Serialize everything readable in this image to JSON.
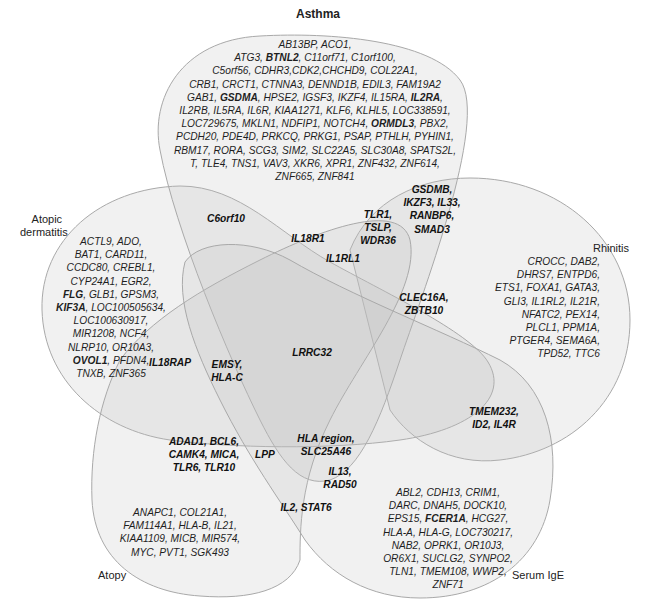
{
  "chart_data": {
    "type": "venn",
    "title": "",
    "sets": [
      "Asthma",
      "Rhinitis",
      "Serum IgE",
      "Atopy",
      "Atopic dermatitis"
    ],
    "note": "Bold gene names are shown in bold in the figure.",
    "regions": [
      {
        "id": "asthma_only",
        "sets": [
          "Asthma"
        ],
        "genes": [
          "AB13BP",
          "ACO1",
          "ATG3",
          "BTNL2",
          "C11orf71",
          "C1orf100",
          "C5orf56",
          "CDHR3",
          "CDK2",
          "CHCHD9",
          "COL22A1",
          "CRB1",
          "CRCT1",
          "CTNNA3",
          "DENND1B",
          "EDIL3",
          "FAM19A2",
          "GAB1",
          "GSDMA",
          "HPSE2",
          "IGSF3",
          "IKZF4",
          "IL15RA",
          "IL2RA",
          "IL2RB",
          "IL5RA",
          "IL6R",
          "KIAA1271",
          "KLF6",
          "KLHL5",
          "LOC338591",
          "LOC729675",
          "MKLN1",
          "NDFIP1",
          "NOTCH4",
          "ORMDL3",
          "PBX2",
          "PCDH20",
          "PDE4D",
          "PRKCQ",
          "PRKG1",
          "PSAP",
          "PTHLH",
          "PYHIN1",
          "RBM17",
          "RORA",
          "SCG3",
          "SIM2",
          "SLC22A5",
          "SLC30A8",
          "SPATS2L",
          "T",
          "TLE4",
          "TNS1",
          "VAV3",
          "XKR6",
          "XPR1",
          "ZNF432",
          "ZNF614",
          "ZNF665",
          "ZNF841"
        ],
        "bold": [
          "BTNL2",
          "GSDMA",
          "IL2RA",
          "ORMDL3"
        ]
      },
      {
        "id": "atopic_dermatitis_only",
        "sets": [
          "Atopic dermatitis"
        ],
        "genes": [
          "ACTL9",
          "ADO",
          "BAT1",
          "CARD11",
          "CCDC80",
          "CREBL1",
          "CYP24A1",
          "EGR2",
          "FLG",
          "GLB1",
          "GPSM3",
          "KIF3A",
          "LOC100505634",
          "LOC100630917",
          "MIR1208",
          "NCF4",
          "NLRP10",
          "OR10A3",
          "OVOL1",
          "PFDN4",
          "TNXB",
          "ZNF365"
        ],
        "bold": [
          "FLG",
          "KIF3A",
          "OVOL1"
        ]
      },
      {
        "id": "rhinitis_only",
        "sets": [
          "Rhinitis"
        ],
        "genes": [
          "CROCC",
          "DAB2",
          "DHRS7",
          "ENTPD6",
          "ETS1",
          "FOXA1",
          "GATA3",
          "GLI3",
          "IL1RL2",
          "IL21R",
          "NFATC2",
          "PEX14",
          "PLCL1",
          "PPM1A",
          "PTGER4",
          "SEMA6A",
          "TPD52",
          "TTC6"
        ],
        "bold": []
      },
      {
        "id": "atopy_only",
        "sets": [
          "Atopy"
        ],
        "genes": [
          "ANAPC1",
          "COL21A1",
          "FAM114A1",
          "HLA-B",
          "IL21",
          "KIAA1109",
          "MICB",
          "MIR574",
          "MYC",
          "PVT1",
          "SGK493"
        ],
        "bold": []
      },
      {
        "id": "serum_ige_only",
        "sets": [
          "Serum IgE"
        ],
        "genes": [
          "ABL2",
          "CDH13",
          "CRIM1",
          "DARC",
          "DNAH5",
          "DOCK10",
          "EPS15",
          "FCER1A",
          "HCG27",
          "HLA-A",
          "HLA-G",
          "LOC730217",
          "NAB2",
          "OPRK1",
          "OR10J3",
          "OR6X1",
          "SUCLG2",
          "SYNPO2",
          "TLN1",
          "TMEM108",
          "WWP2",
          "ZNF71"
        ],
        "bold": [
          "FCER1A"
        ]
      },
      {
        "id": "c6orf10",
        "sets": [
          "Asthma",
          "Atopic dermatitis"
        ],
        "genes": [
          "C6orf10"
        ],
        "bold": [
          "C6orf10"
        ]
      },
      {
        "id": "gsdmb",
        "sets": [
          "Asthma",
          "Rhinitis"
        ],
        "genes": [
          "GSDMB",
          "IKZF3",
          "IL33",
          "RANBP6",
          "SMAD3"
        ],
        "bold": [
          "GSDMB",
          "IKZF3",
          "IL33",
          "RANBP6",
          "SMAD3"
        ]
      },
      {
        "id": "tlr1",
        "sets": [
          "Asthma",
          "Rhinitis",
          "Atopy"
        ],
        "genes": [
          "TLR1",
          "TSLP",
          "WDR36"
        ],
        "bold": [
          "TLR1",
          "TSLP",
          "WDR36"
        ]
      },
      {
        "id": "il18r1",
        "sets": [
          "Asthma",
          "Atopic dermatitis",
          "Atopy",
          "Rhinitis"
        ],
        "genes": [
          "IL18R1"
        ],
        "bold": [
          "IL18R1"
        ]
      },
      {
        "id": "il1rl1",
        "sets": [
          "Asthma",
          "Rhinitis",
          "Atopy",
          "Atopic dermatitis"
        ],
        "genes": [
          "IL1RL1"
        ],
        "bold": [
          "IL1RL1"
        ]
      },
      {
        "id": "clec16a",
        "sets": [
          "Asthma",
          "Rhinitis",
          "Atopic dermatitis"
        ],
        "genes": [
          "CLEC16A",
          "ZBTB10"
        ],
        "bold": [
          "CLEC16A",
          "ZBTB10"
        ]
      },
      {
        "id": "lrrc32",
        "sets": [
          "Asthma",
          "Rhinitis",
          "Serum IgE",
          "Atopy",
          "Atopic dermatitis"
        ],
        "genes": [
          "LRRC32"
        ],
        "bold": [
          "LRRC32"
        ]
      },
      {
        "id": "il18rap",
        "sets": [
          "Atopic dermatitis",
          "Atopy"
        ],
        "genes": [
          "IL18RAP"
        ],
        "bold": [
          "IL18RAP"
        ]
      },
      {
        "id": "emsy",
        "sets": [
          "Asthma",
          "Atopic dermatitis",
          "Atopy"
        ],
        "genes": [
          "EMSY",
          "HLA-C"
        ],
        "bold": [
          "EMSY",
          "HLA-C"
        ]
      },
      {
        "id": "tmem232",
        "sets": [
          "Rhinitis",
          "Serum IgE"
        ],
        "genes": [
          "TMEM232",
          "ID2",
          "IL4R"
        ],
        "bold": [
          "TMEM232",
          "ID2",
          "IL4R"
        ]
      },
      {
        "id": "adad1",
        "sets": [
          "Atopy",
          "Atopic dermatitis",
          "Rhinitis"
        ],
        "genes": [
          "ADAD1",
          "BCL6",
          "CAMK4",
          "MICA",
          "TLR6",
          "TLR10"
        ],
        "bold": [
          "ADAD1",
          "BCL6",
          "CAMK4",
          "MICA",
          "TLR6",
          "TLR10"
        ]
      },
      {
        "id": "lpp",
        "sets": [
          "Asthma",
          "Atopy",
          "Rhinitis"
        ],
        "genes": [
          "LPP"
        ],
        "bold": [
          "LPP"
        ]
      },
      {
        "id": "hla_region",
        "sets": [
          "Asthma",
          "Atopy",
          "Serum IgE",
          "Rhinitis"
        ],
        "genes": [
          "HLA region",
          "SLC25A46"
        ],
        "bold": [
          "HLA region",
          "SLC25A46"
        ]
      },
      {
        "id": "il13",
        "sets": [
          "Asthma",
          "Atopy",
          "Serum IgE"
        ],
        "genes": [
          "IL13",
          "RAD50"
        ],
        "bold": [
          "IL13",
          "RAD50"
        ]
      },
      {
        "id": "il2",
        "sets": [
          "Asthma",
          "Atopy",
          "Serum IgE"
        ],
        "genes": [
          "IL2",
          "STAT6"
        ],
        "bold": [
          "IL2",
          "STAT6"
        ]
      }
    ]
  },
  "labels": {
    "asthma": "Asthma",
    "atopic_dermatitis_1": "Atopic",
    "atopic_dermatitis_2": "dermatitis",
    "rhinitis": "Rhinitis",
    "atopy": "Atopy",
    "serum_ige": "Serum IgE"
  },
  "text_blocks": {
    "asthma": [
      "AB13BP, ACO1,",
      "ATG3, |BTNL2|, C11orf71, C1orf100,",
      "C5orf56, CDHR3,CDK2,CHCHD9, COL22A1,",
      "CRB1, CRCT1, CTNNA3, DENND1B, EDIL3, FAM19A2",
      "GAB1, |GSDMA|, HPSE2, IGSF3, IKZF4, IL15RA, |IL2RA|,",
      "IL2RB, IL5RA, IL6R, KIAA1271, KLF6, KLHL5, LOC338591,",
      "LOC729675, MKLN1, NDFIP1, NOTCH4, |ORMDL3|, PBX2,",
      "PCDH20, PDE4D, PRKCQ, PRKG1, PSAP, PTHLH, PYHIN1,",
      "RBM17, RORA, SCG3, SIM2, SLC22A5, SLC30A8, SPATS2L,",
      "T, TLE4, TNS1, VAV3, XKR6, XPR1, ZNF432, ZNF614,",
      "ZNF665, ZNF841"
    ],
    "atopic_dermatitis": [
      "ACTL9, ADO,",
      "BAT1, CARD11,",
      "CCDC80, CREBL1,",
      "CYP24A1, EGR2,",
      "|FLG|, GLB1, GPSM3,",
      "|KIF3A|, LOC100505634,",
      "LOC100630917,",
      "MIR1208, NCF4,",
      "NLRP10, OR10A3,",
      "|OVOL1|, PFDN4,",
      "TNXB, ZNF365"
    ],
    "rhinitis": [
      "CROCC, DAB2,",
      "DHRS7, ENTPD6,",
      "ETS1, FOXA1, GATA3,",
      "GLI3, IL1RL2, IL21R,",
      "NFATC2, PEX14,",
      "PLCL1, PPM1A,",
      "PTGER4, SEMA6A,",
      "TPD52, TTC6"
    ],
    "atopy": [
      "ANAPC1, COL21A1,",
      "FAM114A1, HLA-B, IL21,",
      "KIAA1109, MICB, MIR574,",
      "MYC, PVT1, SGK493"
    ],
    "serum_ige": [
      "ABL2, CDH13, CRIM1,",
      "DARC, DNAH5, DOCK10,",
      "EPS15, |FCER1A|, HCG27,",
      "HLA-A, HLA-G, LOC730217,",
      "NAB2, OPRK1, OR10J3,",
      "OR6X1, SUCLG2, SYNPO2,",
      "TLN1, TMEM108, WWP2,",
      "ZNF71"
    ],
    "c6orf10": "C6orf10",
    "gsdmb": "GSDMB,\nIKZF3, IL33,\nRANBP6,\nSMAD3",
    "tlr1": "TLR1,\nTSLP,\nWDR36",
    "il18r1": "IL18R1",
    "il1rl1": "IL1RL1",
    "clec16a": "CLEC16A,\nZBTB10",
    "lrrc32": "LRRC32",
    "il18rap": "IL18RAP",
    "emsy": "EMSY,\nHLA-C",
    "tmem232": "TMEM232,\nID2, IL4R",
    "adad1": "ADAD1, BCL6,\nCAMK4, MICA,\nTLR6, TLR10",
    "lpp": "LPP",
    "hla_region": "HLA region,\nSLC25A46",
    "il13": "IL13,\nRAD50",
    "il2": "IL2, STAT6"
  },
  "colors": {
    "fill": "#c8c8c8",
    "stroke": "#a8a8a8",
    "text": "#1e1e1e"
  }
}
